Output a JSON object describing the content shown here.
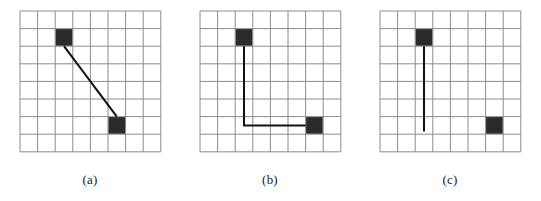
{
  "figure": {
    "background_color": "#ffffff",
    "grid_line_color": "#8c8c8c",
    "cell_fill_color": "#2b2b2b",
    "path_color": "#111111",
    "grid": {
      "cols": 8,
      "rows": 8,
      "cell_size": 17.6,
      "origin_x": 2,
      "origin_y": 2
    },
    "panels": [
      {
        "id": "panel-a",
        "caption": "(a)",
        "description": "Straight diagonal line connecting two filled cells",
        "filled_cells": [
          {
            "name": "start-cell",
            "col": 2,
            "row": 1
          },
          {
            "name": "goal-cell",
            "col": 5,
            "row": 6
          }
        ],
        "path": {
          "type": "straight-line",
          "points": [
            {
              "x": 2.5,
              "y": 2.0
            },
            {
              "x": 5.5,
              "y": 6.0
            }
          ]
        }
      },
      {
        "id": "panel-b",
        "caption": "(b)",
        "description": "L-shaped orthogonal path connecting two filled cells",
        "filled_cells": [
          {
            "name": "start-cell",
            "col": 2,
            "row": 1
          },
          {
            "name": "goal-cell",
            "col": 6,
            "row": 6
          }
        ],
        "path": {
          "type": "orthogonal-polyline",
          "points": [
            {
              "x": 2.5,
              "y": 2.0
            },
            {
              "x": 2.5,
              "y": 6.5
            },
            {
              "x": 6.0,
              "y": 6.5
            }
          ]
        }
      },
      {
        "id": "panel-c",
        "caption": "(c)",
        "description": "Incomplete vertical path; goal cell unconnected",
        "filled_cells": [
          {
            "name": "start-cell",
            "col": 2,
            "row": 1
          },
          {
            "name": "goal-cell",
            "col": 6,
            "row": 6
          }
        ],
        "path": {
          "type": "partial-vertical",
          "points": [
            {
              "x": 2.5,
              "y": 2.0
            },
            {
              "x": 2.5,
              "y": 6.85
            }
          ]
        }
      }
    ]
  }
}
